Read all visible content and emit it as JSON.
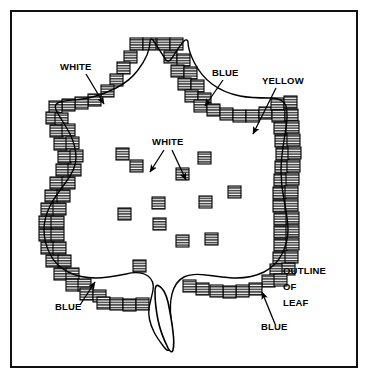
{
  "figure": {
    "background_color": "#ffffff",
    "ink_color": "#000000",
    "border_color": "#111111",
    "block_fill": "#9a9a9a"
  },
  "labels": [
    {
      "id": "white-top-left",
      "text": "WHITE",
      "x": 60,
      "y": 70,
      "anchor": "start"
    },
    {
      "id": "blue-top-right",
      "text": "BLUE",
      "x": 212,
      "y": 76,
      "anchor": "start"
    },
    {
      "id": "yellow-top",
      "text": "YELLOW",
      "x": 262,
      "y": 84,
      "anchor": "start"
    },
    {
      "id": "white-center",
      "text": "WHITE",
      "x": 152,
      "y": 145,
      "anchor": "start"
    },
    {
      "id": "blue-bottom-left",
      "text": "BLUE",
      "x": 55,
      "y": 310,
      "anchor": "start"
    },
    {
      "id": "outline",
      "text": "OUTLINE",
      "x": 283,
      "y": 274,
      "anchor": "start"
    },
    {
      "id": "of",
      "text": "OF",
      "x": 283,
      "y": 290,
      "anchor": "start"
    },
    {
      "id": "leaf",
      "text": "LEAF",
      "x": 283,
      "y": 306,
      "anchor": "start"
    },
    {
      "id": "blue-bottom-right",
      "text": "BLUE",
      "x": 261,
      "y": 330,
      "anchor": "start"
    }
  ],
  "leaf": {
    "outline_path": "M150,42 C150,52 144,62 138,70 C132,78 124,84 116,88 C108,92 98,96 88,98 C78,100 68,100 60,102 C56,103 54,106 56,110 C60,118 66,126 70,134 C74,142 76,150 76,158 C76,166 72,174 66,182 C60,190 54,198 50,206 C46,214 44,222 44,230 C44,238 46,246 50,254 C54,262 60,268 68,272 C76,276 86,278 96,278 C106,278 116,276 126,274 C134,272 142,272 148,276 C152,279 154,284 153,290 C152,296 150,302 149,308 C148,316 150,324 154,332 C157,338 161,343 164,347 C166,350 168,351 170,350 C172,349 173,346 173,342 C173,334 172,326 171,318 C170,310 170,302 172,294 C174,286 178,280 184,277 C190,274 198,274 206,275 C216,276 226,278 236,278 C246,278 256,276 264,272 C272,268 278,262 282,254 C286,246 288,238 288,230 C288,220 286,210 284,200 C282,190 281,180 281,170 C281,158 283,146 285,134 C287,124 288,114 286,106 C284,100 278,98 270,98 C260,98 250,98 240,96 C230,94 220,90 212,84 C204,78 198,70 194,62 C190,54 188,48 188,42 C188,40 186,39 184,41 C180,45 176,52 172,58 C170,61 168,62 166,60 C162,54 157,46 153,40 C151,38 150,39 150,42 Z",
    "stem_path": "M155,292 C155,300 156,310 158,320 C160,330 164,340 168,348 C170,352 172,353 173,350 C174,346 174,340 173,332 C172,322 170,312 168,302 C166,294 163,288 159,286 C156,284 155,287 155,292 Z"
  },
  "border_blocks": [
    {
      "x": 130,
      "y": 38
    },
    {
      "x": 143,
      "y": 38
    },
    {
      "x": 157,
      "y": 38
    },
    {
      "x": 170,
      "y": 38
    },
    {
      "x": 124,
      "y": 51
    },
    {
      "x": 164,
      "y": 51
    },
    {
      "x": 177,
      "y": 54
    },
    {
      "x": 117,
      "y": 62
    },
    {
      "x": 171,
      "y": 65
    },
    {
      "x": 184,
      "y": 67
    },
    {
      "x": 110,
      "y": 74
    },
    {
      "x": 178,
      "y": 78
    },
    {
      "x": 191,
      "y": 80
    },
    {
      "x": 101,
      "y": 85
    },
    {
      "x": 185,
      "y": 90
    },
    {
      "x": 198,
      "y": 93
    },
    {
      "x": 88,
      "y": 94
    },
    {
      "x": 75,
      "y": 97
    },
    {
      "x": 62,
      "y": 99
    },
    {
      "x": 49,
      "y": 101
    },
    {
      "x": 194,
      "y": 100
    },
    {
      "x": 207,
      "y": 104
    },
    {
      "x": 220,
      "y": 108
    },
    {
      "x": 233,
      "y": 110
    },
    {
      "x": 246,
      "y": 110
    },
    {
      "x": 259,
      "y": 107
    },
    {
      "x": 46,
      "y": 112
    },
    {
      "x": 55,
      "y": 113
    },
    {
      "x": 271,
      "y": 98
    },
    {
      "x": 284,
      "y": 96
    },
    {
      "x": 50,
      "y": 125
    },
    {
      "x": 62,
      "y": 124
    },
    {
      "x": 272,
      "y": 110
    },
    {
      "x": 285,
      "y": 109
    },
    {
      "x": 54,
      "y": 138
    },
    {
      "x": 66,
      "y": 137
    },
    {
      "x": 274,
      "y": 122
    },
    {
      "x": 286,
      "y": 121
    },
    {
      "x": 58,
      "y": 151
    },
    {
      "x": 70,
      "y": 150
    },
    {
      "x": 275,
      "y": 135
    },
    {
      "x": 287,
      "y": 134
    },
    {
      "x": 56,
      "y": 164
    },
    {
      "x": 68,
      "y": 164
    },
    {
      "x": 276,
      "y": 148
    },
    {
      "x": 288,
      "y": 147
    },
    {
      "x": 50,
      "y": 177
    },
    {
      "x": 62,
      "y": 177
    },
    {
      "x": 275,
      "y": 161
    },
    {
      "x": 287,
      "y": 160
    },
    {
      "x": 45,
      "y": 190
    },
    {
      "x": 57,
      "y": 190
    },
    {
      "x": 274,
      "y": 174
    },
    {
      "x": 286,
      "y": 173
    },
    {
      "x": 41,
      "y": 203
    },
    {
      "x": 53,
      "y": 203
    },
    {
      "x": 273,
      "y": 187
    },
    {
      "x": 285,
      "y": 186
    },
    {
      "x": 39,
      "y": 216
    },
    {
      "x": 51,
      "y": 216
    },
    {
      "x": 273,
      "y": 200
    },
    {
      "x": 285,
      "y": 199
    },
    {
      "x": 39,
      "y": 229
    },
    {
      "x": 51,
      "y": 229
    },
    {
      "x": 274,
      "y": 213
    },
    {
      "x": 286,
      "y": 212
    },
    {
      "x": 41,
      "y": 242
    },
    {
      "x": 53,
      "y": 242
    },
    {
      "x": 274,
      "y": 226
    },
    {
      "x": 286,
      "y": 225
    },
    {
      "x": 46,
      "y": 255
    },
    {
      "x": 58,
      "y": 255
    },
    {
      "x": 274,
      "y": 239
    },
    {
      "x": 286,
      "y": 238
    },
    {
      "x": 54,
      "y": 268
    },
    {
      "x": 66,
      "y": 268
    },
    {
      "x": 273,
      "y": 252
    },
    {
      "x": 285,
      "y": 251
    },
    {
      "x": 66,
      "y": 279
    },
    {
      "x": 78,
      "y": 279
    },
    {
      "x": 270,
      "y": 264
    },
    {
      "x": 282,
      "y": 263
    },
    {
      "x": 80,
      "y": 288
    },
    {
      "x": 93,
      "y": 290
    },
    {
      "x": 262,
      "y": 275
    },
    {
      "x": 274,
      "y": 274
    },
    {
      "x": 97,
      "y": 297
    },
    {
      "x": 110,
      "y": 298
    },
    {
      "x": 249,
      "y": 283
    },
    {
      "x": 236,
      "y": 285
    },
    {
      "x": 123,
      "y": 299
    },
    {
      "x": 136,
      "y": 298
    },
    {
      "x": 223,
      "y": 286
    },
    {
      "x": 210,
      "y": 285
    },
    {
      "x": 196,
      "y": 283
    },
    {
      "x": 183,
      "y": 280
    }
  ],
  "interior_blocks": [
    {
      "x": 116,
      "y": 148
    },
    {
      "x": 130,
      "y": 160
    },
    {
      "x": 176,
      "y": 168
    },
    {
      "x": 198,
      "y": 152
    },
    {
      "x": 152,
      "y": 197
    },
    {
      "x": 118,
      "y": 208
    },
    {
      "x": 199,
      "y": 196
    },
    {
      "x": 228,
      "y": 186
    },
    {
      "x": 153,
      "y": 218
    },
    {
      "x": 176,
      "y": 235
    },
    {
      "x": 205,
      "y": 233
    },
    {
      "x": 133,
      "y": 260
    }
  ],
  "leader_lines": [
    {
      "id": "white-top-left-arrow",
      "x1": 86,
      "y1": 74,
      "x2": 104,
      "y2": 104
    },
    {
      "id": "blue-top-right-arrow",
      "x1": 223,
      "y1": 80,
      "x2": 205,
      "y2": 106
    },
    {
      "id": "yellow-arrow",
      "x1": 276,
      "y1": 88,
      "x2": 253,
      "y2": 134
    },
    {
      "id": "white-center-arrow-left",
      "x1": 164,
      "y1": 150,
      "x2": 150,
      "y2": 172
    },
    {
      "id": "white-center-arrow-right",
      "x1": 172,
      "y1": 150,
      "x2": 186,
      "y2": 180
    },
    {
      "id": "blue-bottom-left-arrow",
      "x1": 80,
      "y1": 305,
      "x2": 95,
      "y2": 282
    },
    {
      "id": "blue-bottom-right-arrow",
      "x1": 275,
      "y1": 324,
      "x2": 262,
      "y2": 292
    }
  ]
}
